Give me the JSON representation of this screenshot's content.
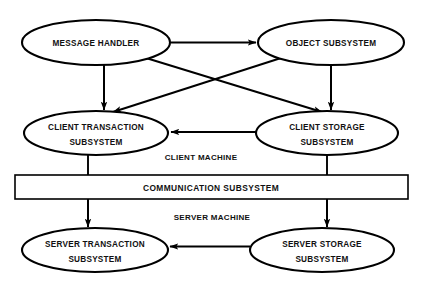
{
  "diagram": {
    "background_color": "#ffffff",
    "stroke_color": "#000000",
    "text_color": "#111111",
    "nodes": {
      "message_handler": {
        "line1": "MESSAGE HANDLER",
        "line2": "",
        "shape": "ellipse"
      },
      "object_subsystem": {
        "line1": "OBJECT SUBSYSTEM",
        "line2": "",
        "shape": "ellipse"
      },
      "client_transaction": {
        "line1": "CLIENT TRANSACTION",
        "line2": "SUBSYSTEM",
        "shape": "ellipse"
      },
      "client_storage": {
        "line1": "CLIENT STORAGE",
        "line2": "SUBSYSTEM",
        "shape": "ellipse"
      },
      "communication": {
        "line1": "COMMUNICATION SUBSYSTEM",
        "line2": "",
        "shape": "rectangle"
      },
      "server_transaction": {
        "line1": "SERVER TRANSACTION",
        "line2": "SUBSYSTEM",
        "shape": "ellipse"
      },
      "server_storage": {
        "line1": "SERVER STORAGE",
        "line2": "SUBSYSTEM",
        "shape": "ellipse"
      }
    },
    "zones": {
      "client_machine": "CLIENT MACHINE",
      "server_machine": "SERVER MACHINE"
    },
    "edges": [
      {
        "id": "mh-to-os",
        "from": "MESSAGE HANDLER",
        "to": "OBJECT SUBSYSTEM",
        "style": "straight-horizontal",
        "arrow": "end"
      },
      {
        "id": "mh-to-ct",
        "from": "MESSAGE HANDLER",
        "to": "CLIENT TRANSACTION SUBSYSTEM",
        "style": "straight-vertical",
        "arrow": "end"
      },
      {
        "id": "mh-to-cs",
        "from": "MESSAGE HANDLER",
        "to": "CLIENT STORAGE SUBSYSTEM",
        "style": "diagonal",
        "arrow": "end"
      },
      {
        "id": "os-to-cs",
        "from": "OBJECT SUBSYSTEM",
        "to": "CLIENT STORAGE SUBSYSTEM",
        "style": "straight-vertical",
        "arrow": "end"
      },
      {
        "id": "os-to-ct",
        "from": "OBJECT SUBSYSTEM",
        "to": "CLIENT TRANSACTION SUBSYSTEM",
        "style": "diagonal",
        "arrow": "end"
      },
      {
        "id": "cs-to-ct",
        "from": "CLIENT STORAGE SUBSYSTEM",
        "to": "CLIENT TRANSACTION SUBSYSTEM",
        "style": "straight-horizontal",
        "arrow": "end"
      },
      {
        "id": "ct-to-comm",
        "from": "CLIENT TRANSACTION SUBSYSTEM",
        "to": "COMMUNICATION SUBSYSTEM",
        "style": "straight-vertical",
        "arrow": "none"
      },
      {
        "id": "cs-to-comm",
        "from": "CLIENT STORAGE SUBSYSTEM",
        "to": "COMMUNICATION SUBSYSTEM",
        "style": "straight-vertical",
        "arrow": "none"
      },
      {
        "id": "comm-to-st",
        "from": "COMMUNICATION SUBSYSTEM",
        "to": "SERVER TRANSACTION SUBSYSTEM",
        "style": "straight-vertical",
        "arrow": "end"
      },
      {
        "id": "comm-to-ss",
        "from": "COMMUNICATION SUBSYSTEM",
        "to": "SERVER STORAGE SUBSYSTEM",
        "style": "straight-vertical",
        "arrow": "end"
      },
      {
        "id": "ss-to-st",
        "from": "SERVER STORAGE SUBSYSTEM",
        "to": "SERVER TRANSACTION SUBSYSTEM",
        "style": "straight-horizontal",
        "arrow": "end"
      }
    ]
  }
}
